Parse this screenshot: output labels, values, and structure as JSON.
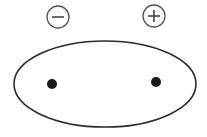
{
  "diagram": {
    "background": "#ffffff",
    "stroke_color": "#2a2a2a",
    "sign_stroke_color": "#555555",
    "ellipse": {
      "cx": 105,
      "cy": 84,
      "rx": 91,
      "ry": 43
    },
    "charges": [
      {
        "label": "negative",
        "symbol": "−",
        "marker": {
          "cx": 58,
          "cy": 17,
          "r": 11
        },
        "dot": {
          "cx": 52,
          "cy": 84,
          "r": 5
        }
      },
      {
        "label": "positive",
        "symbol": "+",
        "marker": {
          "cx": 154,
          "cy": 16,
          "r": 11
        },
        "dot": {
          "cx": 156,
          "cy": 82,
          "r": 5
        }
      }
    ]
  }
}
